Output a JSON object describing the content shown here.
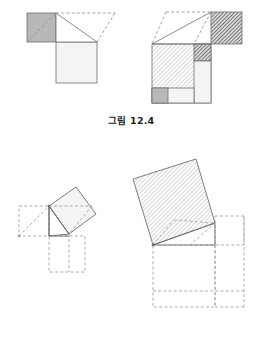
{
  "document": {
    "title": "그림 12.4 / 그림 12.5",
    "background_color": "#ffffff",
    "ink_color": "#231f20",
    "width": 262,
    "height": 357
  },
  "palette": {
    "stroke_solid": "#6e6e6e",
    "stroke_dashed": "#8c8c8c",
    "fill_light_gray": "#f2f2f0",
    "fill_mid_gray": "#b8b8b8",
    "fill_dark_hatch": "#7a7a7a",
    "hatch_light": "#c9c9c9",
    "hatch_dark": "#5f5f5f",
    "white": "#ffffff"
  },
  "figures": [
    {
      "id": "fig-12-4",
      "caption_label": "그림",
      "caption_number": "12.4",
      "description": "Pythagorean dissection proof: a right triangle with squares on its legs (left panel) rearranged into a square on the hypotenuse (right panel).",
      "panels": [
        {
          "id": "fig-12-4-left",
          "name": "triangle-with-leg-squares",
          "shapes": [
            {
              "name": "small-gray-square",
              "fill": "mid_gray",
              "note": "square on the shorter leg, upper-left"
            },
            {
              "name": "large-light-square",
              "fill": "light_gray",
              "note": "square on the longer leg, lower-right"
            },
            {
              "name": "right-triangle",
              "fill": "white",
              "note": "the right triangle between the two squares"
            },
            {
              "name": "dashed-construction-lines",
              "fill": "none",
              "note": "dashed guides showing the rearrangement"
            }
          ]
        },
        {
          "id": "fig-12-4-right",
          "name": "hypotenuse-square-dissection",
          "shapes": [
            {
              "name": "big-hatched-square",
              "fill": "hatch_light",
              "note": "main dissected square"
            },
            {
              "name": "dark-hatched-rect-top",
              "fill": "hatch_dark",
              "note": "dark hatched rectangle, top right"
            },
            {
              "name": "dark-hatched-square-inner",
              "fill": "hatch_dark",
              "note": "dark hatched block inside, right side"
            },
            {
              "name": "light-rect-right",
              "fill": "light_gray",
              "note": "light vertical strip at right"
            },
            {
              "name": "mid-gray-square-bottom-left",
              "fill": "mid_gray",
              "note": "small gray square, bottom left"
            },
            {
              "name": "light-rect-bottom",
              "fill": "light_gray",
              "note": "light rectangle along the bottom"
            },
            {
              "name": "white-triangle-top",
              "fill": "white",
              "note": "white triangular region above the square"
            },
            {
              "name": "dashed-construction-lines",
              "fill": "none",
              "note": "dashed guides"
            }
          ]
        }
      ]
    },
    {
      "id": "fig-12-5",
      "caption_label": "그림",
      "caption_number": "12.5",
      "description": "Tilted square on the hypotenuse shown small (left) and enlarged (right) with dashed squares on the legs.",
      "panels": [
        {
          "id": "fig-12-5-left",
          "name": "small-tilted-square-construction",
          "shapes": [
            {
              "name": "tilted-light-square",
              "fill": "light_gray",
              "note": "rotated square on the hypotenuse"
            },
            {
              "name": "dashed-square-on-short-leg",
              "fill": "none",
              "note": "dashed square, left"
            },
            {
              "name": "dashed-square-on-long-leg",
              "fill": "none",
              "note": "dashed square, below"
            },
            {
              "name": "solid-right-triangle",
              "fill": "none",
              "note": "right triangle outline"
            },
            {
              "name": "dashed-diagonals",
              "fill": "none",
              "note": "dashed interior diagonals"
            }
          ]
        },
        {
          "id": "fig-12-5-right",
          "name": "large-tilted-square-construction",
          "shapes": [
            {
              "name": "tilted-hatched-square",
              "fill": "hatch_light",
              "note": "large rotated hatched square on the hypotenuse"
            },
            {
              "name": "dashed-square-on-short-leg",
              "fill": "none",
              "note": "dashed square, right"
            },
            {
              "name": "dashed-square-on-long-leg",
              "fill": "none",
              "note": "dashed square, below"
            },
            {
              "name": "solid-right-triangle",
              "fill": "none",
              "note": "right triangle outline"
            },
            {
              "name": "dashed-diagonals",
              "fill": "none",
              "note": "dashed interior diagonals"
            }
          ]
        }
      ]
    }
  ]
}
